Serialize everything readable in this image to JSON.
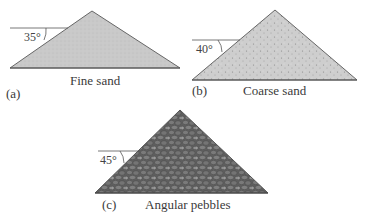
{
  "figure": {
    "panels": [
      {
        "id": "a",
        "tag": "(a)",
        "caption": "Fine sand",
        "angle": "35°",
        "angle_deg": 35
      },
      {
        "id": "b",
        "tag": "(b)",
        "caption": "Coarse sand",
        "angle": "40°",
        "angle_deg": 40
      },
      {
        "id": "c",
        "tag": "(c)",
        "caption": "Angular pebbles",
        "angle": "45°",
        "angle_deg": 45
      }
    ],
    "colors": {
      "fine_sand": "#c8c8c8",
      "coarse_sand": "#cdcdcd",
      "pebbles": "#707070",
      "outline": "#555555"
    }
  }
}
